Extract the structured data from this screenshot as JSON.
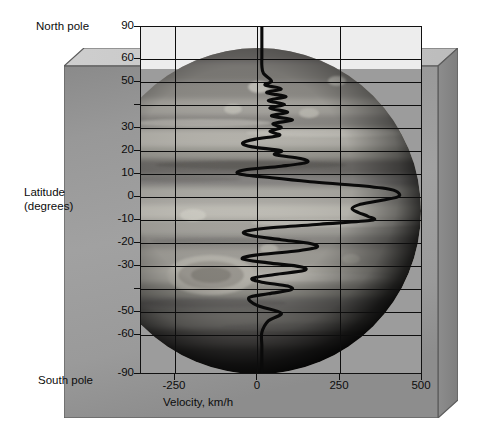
{
  "figure": {
    "title": "",
    "north_pole_label": "North pole",
    "south_pole_label": "South pole",
    "latitude_axis_label_line1": "Latitude",
    "latitude_axis_label_line2": "(degrees)",
    "velocity_axis_label": "Velocity, km/h",
    "background_image": "jupiter-globe-photo",
    "colors": {
      "curve": "#0a0a0a",
      "grid": "#0d0d0d",
      "frame": "#111111",
      "slab_face": "#9b9b9b",
      "slab_top": "#c9c9c9",
      "page": "#ffffff"
    }
  },
  "chart_data": {
    "type": "line",
    "title": "",
    "xlabel": "Velocity, km/h",
    "ylabel": "Latitude (degrees)",
    "xlim": [
      -375,
      500
    ],
    "ylim": [
      -90,
      90
    ],
    "grid": true,
    "legend": "none",
    "orientation": "horizontal-value-vertical-category",
    "xticks": [
      -250,
      0,
      250,
      500
    ],
    "xticklabels": [
      "-250",
      "0",
      "250",
      "500"
    ],
    "yticks": [
      90,
      60,
      50,
      40,
      30,
      20,
      10,
      0,
      -10,
      -20,
      -30,
      -40,
      -50,
      -60,
      -90
    ],
    "yticklabels": [
      "90",
      "60",
      "50",
      "",
      "30",
      "20",
      "10",
      "0",
      "-10",
      "-20",
      "-30",
      "",
      "-50",
      "-60",
      "-90"
    ],
    "xgridlines": [
      -250,
      0,
      250
    ],
    "ygridlines": [
      60,
      50,
      40,
      30,
      20,
      10,
      0,
      -10,
      -20,
      -30,
      -40,
      -50,
      -60
    ],
    "series": [
      {
        "name": "Zonal wind velocity",
        "latitude": [
          90,
          82,
          75,
          70,
          66,
          62,
          60,
          58,
          56,
          54,
          52,
          50,
          48,
          46,
          44,
          42,
          40,
          38,
          36,
          34,
          32,
          30,
          28,
          26,
          24,
          22,
          20,
          18,
          16,
          14,
          12,
          10,
          8,
          6,
          4,
          2,
          0,
          -2,
          -4,
          -6,
          -8,
          -10,
          -12,
          -14,
          -16,
          -18,
          -20,
          -22,
          -24,
          -26,
          -28,
          -30,
          -32,
          -34,
          -36,
          -38,
          -40,
          -42,
          -44,
          -46,
          -48,
          -50,
          -54,
          -58,
          -62,
          -68,
          -75,
          -82,
          -90
        ],
        "velocity": [
          0,
          0,
          0,
          0,
          5,
          30,
          10,
          60,
          15,
          75,
          20,
          70,
          25,
          80,
          30,
          95,
          35,
          60,
          25,
          55,
          -20,
          -60,
          -30,
          60,
          40,
          120,
          140,
          60,
          -55,
          -70,
          30,
          150,
          300,
          400,
          425,
          420,
          360,
          300,
          280,
          300,
          330,
          340,
          180,
          20,
          -55,
          -30,
          60,
          150,
          170,
          100,
          -20,
          -60,
          20,
          120,
          130,
          40,
          -30,
          0,
          80,
          90,
          20,
          -40,
          -15,
          60,
          20,
          0,
          0,
          0,
          0
        ]
      }
    ]
  }
}
